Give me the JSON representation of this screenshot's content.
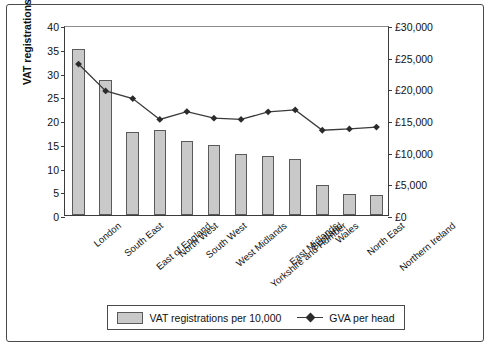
{
  "chart_data": {
    "type": "bar",
    "title": "",
    "xlabel": "",
    "ylabel": "VAT registrations",
    "y2label": "GVA per head",
    "ylim": [
      0,
      40
    ],
    "y2lim": [
      0,
      30000
    ],
    "grid": false,
    "legend_position": "bottom",
    "categories": [
      "London",
      "South East",
      "East of England",
      "North West",
      "South West",
      "West Midlands",
      "Yorkshire and Humber",
      "East Midlands",
      "Scotland",
      "Wales",
      "North East",
      "Northern Ireland"
    ],
    "yticks": [
      "0",
      "5",
      "10",
      "15",
      "20",
      "25",
      "30",
      "35",
      "40"
    ],
    "y2ticks": [
      "£0",
      "£5,000",
      "£10,000",
      "£15,000",
      "£20,000",
      "£25,000",
      "£30,000"
    ],
    "series": [
      {
        "name": "VAT registrations per 10,000",
        "type": "bar",
        "axis": "left",
        "values": [
          34.9,
          28.5,
          17.5,
          17.8,
          15.6,
          14.8,
          12.8,
          12.5,
          11.8,
          6.3,
          4.4,
          4.2
        ]
      },
      {
        "name": "GVA per head",
        "type": "line",
        "axis": "right",
        "marker": "diamond",
        "values": [
          24150,
          19900,
          18700,
          15400,
          16650,
          15600,
          15400,
          16600,
          16900,
          13700,
          13900,
          14200
        ]
      }
    ]
  },
  "legend": {
    "bar_label": "VAT registrations per 10,000",
    "line_label": "GVA per head"
  }
}
